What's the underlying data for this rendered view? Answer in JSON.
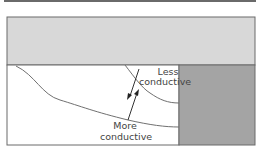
{
  "diagram": {
    "labels": {
      "less_conductive_line1": "Less",
      "less_conductive_line2": "conductive",
      "more_conductive_line1": "More",
      "more_conductive_line2": "conductive"
    },
    "colors": {
      "top_band": "#d8d8d8",
      "right_block": "#a4a4a4",
      "lines": "#707070",
      "frame": "#6a6a6a",
      "text": "#444444"
    },
    "regions": [
      "top-layer",
      "lower-medium",
      "right-block"
    ],
    "arrows": [
      "downward-arrow",
      "upward-arrow"
    ]
  }
}
